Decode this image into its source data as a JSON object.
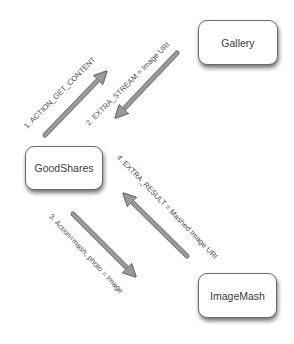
{
  "diagram": {
    "nodes": [
      {
        "id": "gallery",
        "label": "Gallery"
      },
      {
        "id": "goodshares",
        "label": "GoodShares"
      },
      {
        "id": "imagemash",
        "label": "ImageMash"
      }
    ],
    "edges": [
      {
        "id": "e1",
        "from": "goodshares",
        "to": "gallery",
        "label": "1. ACTION_GET_CONTENT"
      },
      {
        "id": "e2",
        "from": "gallery",
        "to": "goodshares",
        "label": "2. EXTRA_STREAM = Image URI"
      },
      {
        "id": "e3",
        "from": "goodshares",
        "to": "imagemash",
        "label": "3. Action=mash, photo = Image"
      },
      {
        "id": "e4",
        "from": "imagemash",
        "to": "goodshares",
        "label": "4. EXTRA_RESULT = Mashed Image URI"
      }
    ]
  },
  "colors": {
    "arrow_fill": "#9a9a9a",
    "arrow_stroke": "#6e6e6e",
    "node_border": "#6a6a6a",
    "text": "#4a4a4a"
  }
}
